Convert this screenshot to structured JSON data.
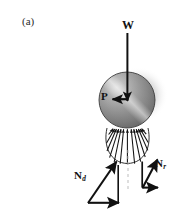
{
  "figure": {
    "panel_label": "(a)",
    "caption_labels": {
      "weight": "W",
      "applied_load": "P",
      "driving_reaction_base": "N",
      "driving_reaction_sub": "d",
      "resisting_reaction_base": "N",
      "resisting_reaction_sub": "r"
    },
    "colors": {
      "background": "#ffffff",
      "ink": "#111111",
      "ground_line": "#4a4a4a",
      "sphere_light": "#f2f2f2",
      "sphere_mid": "#9a9a9a",
      "sphere_dark": "#4e4e4e",
      "shadow": "#cfcfcf",
      "centerline": "#b9b9b9"
    },
    "elements": [
      {
        "name": "sphere",
        "type": "shaded-circle",
        "cx": 127,
        "cy": 100,
        "r": 28
      },
      {
        "name": "ground-line",
        "type": "line",
        "x1": 68,
        "y1": 128,
        "x2": 183,
        "y2": 128
      },
      {
        "name": "weight-arrow",
        "type": "arrow",
        "x1": 127,
        "y1": 33,
        "x2": 127,
        "y2": 101
      },
      {
        "name": "applied-load-arrow",
        "type": "arrow",
        "x1": 128,
        "y1": 99,
        "x2": 113,
        "y2": 99
      },
      {
        "name": "pressure-distribution",
        "type": "radial-arrow-fan",
        "count": 13,
        "cx": 127,
        "cy": 128,
        "rx": 20,
        "ry": 35
      },
      {
        "name": "centerline",
        "type": "dashed-line",
        "x1": 128,
        "y1": 150,
        "x2": 128,
        "y2": 188
      },
      {
        "name": "driving-reaction-vector",
        "type": "vector-triangle",
        "origin_x": 88,
        "origin_y": 203,
        "tip_x": 116,
        "tip_y": 162
      },
      {
        "name": "resisting-reaction-vector",
        "type": "vector-triangle",
        "origin_x": 142,
        "origin_y": 188,
        "tip_x": 157,
        "tip_y": 160
      }
    ]
  }
}
